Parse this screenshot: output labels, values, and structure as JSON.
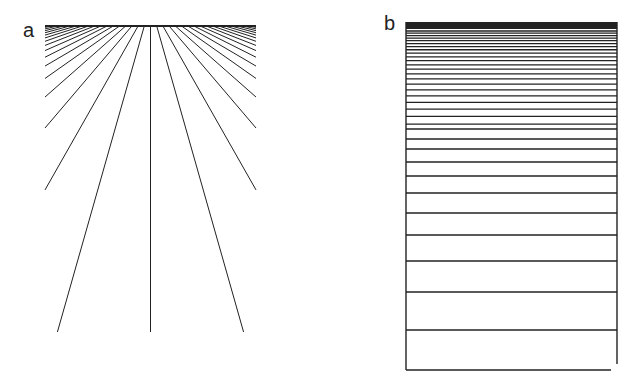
{
  "figure": {
    "panels": [
      {
        "label": "a",
        "type": "radial-fan-lines",
        "description": "Lines fanning out from a horizontal top bar, spreading outward toward the bottom",
        "top_bar": {
          "x1": 45,
          "x2": 256,
          "y": 26
        },
        "bottom_endpoints_x": [
          53,
          86,
          119,
          152,
          185,
          218,
          251
        ],
        "bottom_y": 332
      },
      {
        "label": "b",
        "type": "horizontal-gradient-lines",
        "description": "Rectangle filled with horizontal lines whose spacing increases from top to bottom",
        "box": {
          "x1": 406,
          "y1": 22,
          "x2": 617,
          "y2": 370
        },
        "line_y_lower": [
          129,
          139,
          149,
          162,
          176,
          193,
          213,
          235,
          261,
          292,
          330
        ]
      }
    ]
  },
  "colors": {
    "ink": "#222222",
    "background": "#ffffff"
  }
}
